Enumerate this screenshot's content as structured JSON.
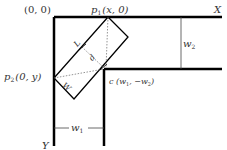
{
  "diagram": {
    "type": "geometry",
    "labels": {
      "origin": "(0, 0)",
      "p1": "p",
      "p1_sub": "1",
      "p1_coords": "(x, 0)",
      "p2": "p",
      "p2_sub": "2",
      "p2_coords": "(0, y)",
      "c": "c (w",
      "c_sub1": "1",
      "c_mid": ", −w",
      "c_sub2": "2",
      "c_end": ")",
      "x_axis": "X",
      "y_axis": "Y",
      "w1": "w",
      "w1_sub": "1",
      "w2": "w",
      "w2_sub": "2",
      "L": "L",
      "d": "d",
      "W": "W"
    },
    "colors": {
      "line": "#000000",
      "text": "#333333",
      "dashed": "#666666"
    }
  }
}
